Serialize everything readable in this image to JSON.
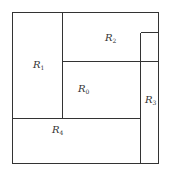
{
  "diagram": {
    "type": "rectangle-partition",
    "line_color": "#333333",
    "outer_box": {
      "x1": 12,
      "y1": 12,
      "x2": 158,
      "y2": 163
    },
    "regions": [
      {
        "id": "R1",
        "letter": "R",
        "sub": "1",
        "label_x": 33,
        "label_y": 68
      },
      {
        "id": "R2",
        "letter": "R",
        "sub": "2",
        "label_x": 105,
        "label_y": 41
      },
      {
        "id": "R0",
        "letter": "R",
        "sub": "0",
        "label_x": 78,
        "label_y": 92
      },
      {
        "id": "R3",
        "letter": "R",
        "sub": "3",
        "label_x": 145,
        "label_y": 103
      },
      {
        "id": "R4",
        "letter": "R",
        "sub": "4",
        "label_x": 52,
        "label_y": 133
      }
    ],
    "lines": [
      {
        "name": "r1-right-divider",
        "x1": 62,
        "y1": 12,
        "x2": 62,
        "y2": 118
      },
      {
        "name": "r0-top-divider",
        "x1": 62,
        "y1": 61,
        "x2": 158,
        "y2": 61
      },
      {
        "name": "r4-top-divider",
        "x1": 12,
        "y1": 118,
        "x2": 140,
        "y2": 118
      },
      {
        "name": "r3-left-edge",
        "x1": 140,
        "y1": 32,
        "x2": 140,
        "y2": 163
      },
      {
        "name": "r3-top-edge",
        "x1": 140,
        "y1": 32,
        "x2": 158,
        "y2": 32
      }
    ]
  }
}
